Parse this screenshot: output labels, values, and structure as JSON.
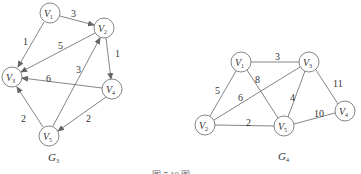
{
  "graphs": [
    {
      "id": "G3",
      "label": "G",
      "label_sub": "3",
      "directed": true,
      "nodes": [
        {
          "id": "V1",
          "base": "V",
          "sub": "1",
          "x": 50,
          "y": 13
        },
        {
          "id": "V2",
          "base": "V",
          "sub": "2",
          "x": 104,
          "y": 28
        },
        {
          "id": "V3",
          "base": "V",
          "sub": "3",
          "x": 12,
          "y": 77
        },
        {
          "id": "V4",
          "base": "V",
          "sub": "4",
          "x": 112,
          "y": 89
        },
        {
          "id": "V5",
          "base": "V",
          "sub": "5",
          "x": 49,
          "y": 136
        }
      ],
      "edges": [
        {
          "from": "V1",
          "to": "V2",
          "weight": "3"
        },
        {
          "from": "V1",
          "to": "V3",
          "weight": "1"
        },
        {
          "from": "V2",
          "to": "V3",
          "weight": "5"
        },
        {
          "from": "V2",
          "to": "V4",
          "weight": "1"
        },
        {
          "from": "V4",
          "to": "V3",
          "weight": "6"
        },
        {
          "from": "V5",
          "to": "V2",
          "weight": "3"
        },
        {
          "from": "V4",
          "to": "V5",
          "weight": "2"
        },
        {
          "from": "V5",
          "to": "V3",
          "weight": "2"
        }
      ]
    },
    {
      "id": "G4",
      "label": "G",
      "label_sub": "4",
      "directed": false,
      "nodes": [
        {
          "id": "V1",
          "base": "V",
          "sub": "1",
          "x": 241,
          "y": 62
        },
        {
          "id": "V2",
          "base": "V",
          "sub": "2",
          "x": 205,
          "y": 125
        },
        {
          "id": "V3",
          "base": "V",
          "sub": "3",
          "x": 309,
          "y": 62
        },
        {
          "id": "V4",
          "base": "V",
          "sub": "4",
          "x": 345,
          "y": 111
        },
        {
          "id": "V5",
          "base": "V",
          "sub": "5",
          "x": 284,
          "y": 126
        }
      ],
      "edges": [
        {
          "from": "V1",
          "to": "V3",
          "weight": "3"
        },
        {
          "from": "V1",
          "to": "V2",
          "weight": "5"
        },
        {
          "from": "V1",
          "to": "V5",
          "weight": "8"
        },
        {
          "from": "V2",
          "to": "V3",
          "weight": "6"
        },
        {
          "from": "V3",
          "to": "V5",
          "weight": "4"
        },
        {
          "from": "V3",
          "to": "V4",
          "weight": "11"
        },
        {
          "from": "V2",
          "to": "V5",
          "weight": "2"
        },
        {
          "from": "V5",
          "to": "V4",
          "weight": "10"
        }
      ]
    }
  ],
  "caption": "图 7.10   图"
}
